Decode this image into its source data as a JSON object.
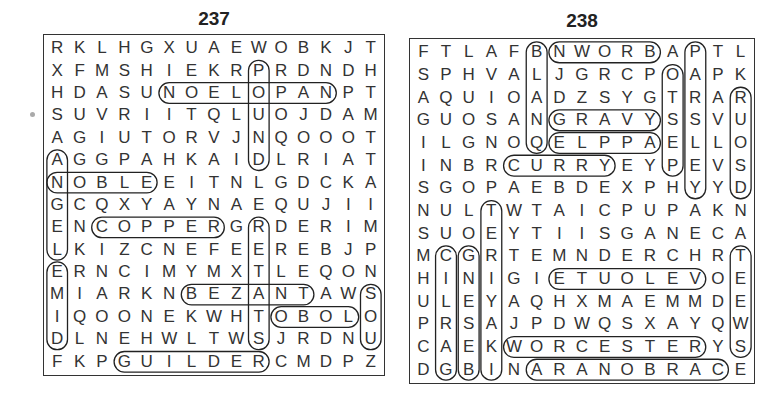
{
  "puzzles": [
    {
      "number": "237",
      "rows": [
        "RKLHGXUAEWOBKJT",
        "XFMSHIEKRPRDNDH",
        "HDASUNOELOPANPT",
        "SUVRIITQLUOJDAM",
        "AGIUTORVJNQOOOT",
        "AGGPAHKAIDLRIAT",
        "NOBLEEITNLGDCKA",
        "GCQXYAYNAEQUJII",
        "ENCOPPERGRDERIM",
        "LKIZCNEFEEREBJP",
        "ERNCIMYMXTLEQON",
        "MIARKNBEZANTAWS",
        "IQOONEKWHTOBOLO",
        "DLNEHWLTWSJRDNU",
        "FKPGUILDERCMDPZ"
      ],
      "found_words": [
        {
          "word": "NOBLE",
          "start": [
            6,
            0
          ],
          "end": [
            6,
            4
          ]
        },
        {
          "word": "COPPER",
          "start": [
            8,
            2
          ],
          "end": [
            8,
            7
          ]
        },
        {
          "word": "GUILDER",
          "start": [
            14,
            3
          ],
          "end": [
            14,
            9
          ]
        },
        {
          "word": "NAPOLEON",
          "start": [
            2,
            12
          ],
          "end": [
            2,
            5
          ]
        },
        {
          "word": "BEZANT",
          "start": [
            11,
            6
          ],
          "end": [
            11,
            11
          ]
        },
        {
          "word": "OBOL",
          "start": [
            12,
            10
          ],
          "end": [
            12,
            13
          ]
        },
        {
          "word": "ANGEL",
          "start": [
            5,
            0
          ],
          "end": [
            9,
            0
          ]
        },
        {
          "word": "DIME",
          "start": [
            13,
            0
          ],
          "end": [
            10,
            0
          ]
        },
        {
          "word": "POUND",
          "start": [
            1,
            9
          ],
          "end": [
            5,
            9
          ]
        },
        {
          "word": "SOU",
          "start": [
            11,
            14
          ],
          "end": [
            13,
            14
          ]
        },
        {
          "word": "TALENT",
          "start": [
            13,
            9
          ],
          "end": [
            8,
            9
          ]
        }
      ]
    },
    {
      "number": "238",
      "rows": [
        "FTLAFBNWORBAPTL",
        "SPHVALJGRCPOAPK",
        "AQUIOADZSYGTRAR",
        "GUOSANGRAVYSSVU",
        "ILGNOQELPPAELLO",
        "INBRCURRYEYPEVS",
        "SGOPAEBDEXPHYYD",
        "NULTWTAICPUPAKN",
        "SUOEYTIISGANECA",
        "MCGRTEMNDERCHRT",
        "HINIGIETUOLEVOE",
        "ULEYAQHXMAEMMDE",
        "PRSAJPDWQSXAYQW",
        "CAEKWORCESTERYS",
        "DGBINARANOBRACE"
      ],
      "found_words": [
        {
          "word": "BROWN",
          "start": [
            0,
            10
          ],
          "end": [
            0,
            6
          ]
        },
        {
          "word": "GRAVY",
          "start": [
            3,
            6
          ],
          "end": [
            3,
            10
          ]
        },
        {
          "word": "APPLE",
          "start": [
            4,
            10
          ],
          "end": [
            4,
            6
          ]
        },
        {
          "word": "CURRY",
          "start": [
            5,
            4
          ],
          "end": [
            5,
            8
          ]
        },
        {
          "word": "VELOUTE",
          "start": [
            10,
            12
          ],
          "end": [
            10,
            6
          ]
        },
        {
          "word": "WORCESTER",
          "start": [
            13,
            4
          ],
          "end": [
            13,
            12
          ]
        },
        {
          "word": "CARBONARA",
          "start": [
            14,
            13
          ],
          "end": [
            14,
            5
          ]
        },
        {
          "word": "BLANC",
          "start": [
            0,
            5
          ],
          "end": [
            4,
            5
          ]
        },
        {
          "word": "PESTO",
          "start": [
            5,
            11
          ],
          "end": [
            1,
            11
          ]
        },
        {
          "word": "PARSLEY",
          "start": [
            0,
            12
          ],
          "end": [
            6,
            12
          ]
        },
        {
          "word": "ROUSSE",
          "start": [
            2,
            14
          ],
          "end": [
            6,
            14
          ]
        },
        {
          "word": "TERIYAKI",
          "start": [
            7,
            3
          ],
          "end": [
            14,
            3
          ]
        },
        {
          "word": "GINGER",
          "start": [
            9,
            2
          ],
          "end": [
            14,
            2
          ]
        },
        {
          "word": "SWEET",
          "start": [
            13,
            14
          ],
          "end": [
            9,
            14
          ]
        },
        {
          "word": "CILRAG",
          "start": [
            9,
            1
          ],
          "end": [
            14,
            1
          ]
        }
      ]
    }
  ]
}
